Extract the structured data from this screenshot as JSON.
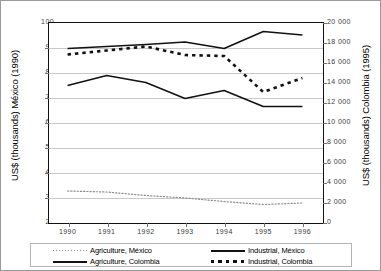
{
  "chart_data": {
    "type": "line",
    "title": "",
    "xlabel": "",
    "categories": [
      "1990",
      "1991",
      "1992",
      "1993",
      "1994",
      "1995",
      "1996"
    ],
    "x": [
      1990,
      1991,
      1992,
      1993,
      1994,
      1995,
      1996
    ],
    "grid": true,
    "legend_position": "bottom",
    "axes": {
      "left": {
        "label": "US$ (thousands) México (1990)",
        "ylim": [
          20,
          100
        ],
        "ticks": [
          20,
          30,
          40,
          50,
          60,
          70,
          80,
          90,
          100
        ],
        "tick_labels": [
          "20",
          "30",
          "40",
          "50",
          "60",
          "70",
          "80",
          "90",
          "100"
        ]
      },
      "right": {
        "label": "US$ (thousands) Colombia (1995)",
        "ylim": [
          0,
          20000
        ],
        "ticks": [
          0,
          2000,
          4000,
          6000,
          8000,
          10000,
          12000,
          14000,
          16000,
          18000,
          20000
        ],
        "tick_labels": [
          "0",
          "2 000",
          "4 000",
          "6 000",
          "8 000",
          "10 000",
          "12 000",
          "14 000",
          "16 000",
          "18 000",
          "20 000"
        ]
      },
      "x": {
        "tick_labels": [
          "1990",
          "1991",
          "1992",
          "1993",
          "1994",
          "1995",
          "1996"
        ]
      }
    },
    "series": [
      {
        "name": "Agriculture, México",
        "axis": "left",
        "style": "dotted",
        "color": "#8c8c8c",
        "values": [
          32.4,
          32.0,
          30.6,
          29.6,
          28.2,
          27.0,
          27.6
        ]
      },
      {
        "name": "Agriculture, Colombia",
        "axis": "left",
        "style": "solid",
        "color": "#111111",
        "values": [
          74.6,
          78.6,
          75.8,
          69.4,
          72.6,
          66.2,
          66.2
        ]
      },
      {
        "name": "Industrial, México",
        "axis": "left",
        "style": "solid",
        "color": "#111111",
        "values": [
          89.4,
          90.2,
          91.0,
          92.0,
          89.4,
          96.2,
          94.8
        ]
      },
      {
        "name": "Industrial, Colombia",
        "axis": "left",
        "style": "dashed",
        "color": "#111111",
        "values": [
          87.0,
          88.6,
          90.2,
          86.8,
          86.4,
          72.0,
          77.6
        ]
      }
    ]
  },
  "legend": {
    "items": [
      {
        "label": "Agriculture, México",
        "style": "dotted"
      },
      {
        "label": "Agriculture, Colombia",
        "style": "solid"
      },
      {
        "label": "Industrial, México",
        "style": "solid"
      },
      {
        "label": "Industrial, Colombia",
        "style": "dashed"
      }
    ]
  }
}
